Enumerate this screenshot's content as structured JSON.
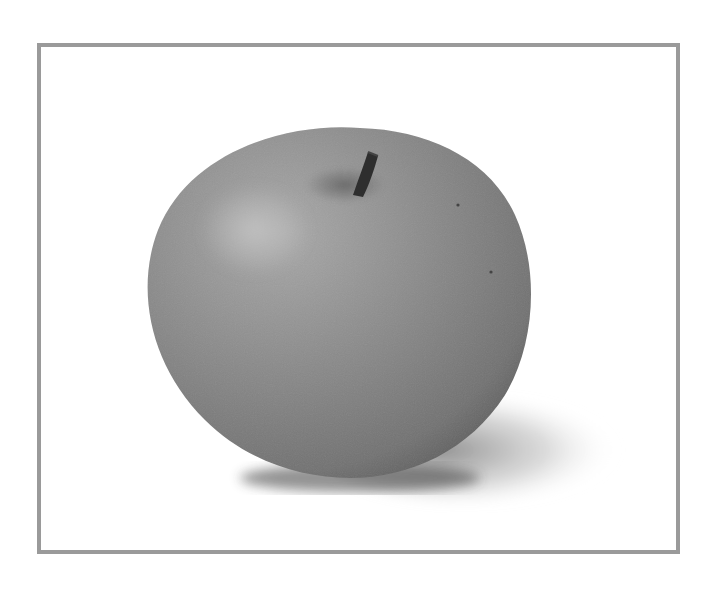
{
  "image": {
    "subject": "apple",
    "description": "Grayscale photograph of a single apple with stem, casting a soft shadow to the lower right, inside a gray rectangular border",
    "colors": {
      "background": "#ffffff",
      "border": "#9a9a9a",
      "apple_mid": "#8a8a8a",
      "apple_dark": "#5e5e5e",
      "apple_highlight": "#b8b8b8",
      "stem": "#2e2e2e",
      "shadow": "#7a7a7a"
    }
  }
}
